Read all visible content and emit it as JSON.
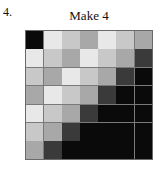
{
  "figure": {
    "item_number": "4.",
    "title": "Make 4"
  },
  "grid": {
    "rows": 7,
    "columns": 7,
    "palette": {
      "black": "#0a0a0a",
      "dark": "#3a3a3a",
      "mid": "#a8a8a8",
      "light_mid": "#c8c8c8",
      "very_light": "#e8e8e8"
    },
    "border_color": "#6a6a6a",
    "gridline_color": "#7a7a7a",
    "shade_names": [
      [
        "black",
        "very_light",
        "light_mid",
        "mid",
        "very_light",
        "light_mid",
        "mid"
      ],
      [
        "very_light",
        "light_mid",
        "mid",
        "very_light",
        "light_mid",
        "mid",
        "dark"
      ],
      [
        "light_mid",
        "mid",
        "very_light",
        "light_mid",
        "mid",
        "dark",
        "black"
      ],
      [
        "mid",
        "very_light",
        "light_mid",
        "mid",
        "dark",
        "black",
        "black"
      ],
      [
        "very_light",
        "light_mid",
        "mid",
        "dark",
        "black",
        "black",
        "black"
      ],
      [
        "light_mid",
        "mid",
        "dark",
        "black",
        "black",
        "black",
        "black"
      ],
      [
        "mid",
        "dark",
        "black",
        "black",
        "black",
        "black",
        "black"
      ]
    ]
  },
  "chart_data": {
    "type": "heatmap",
    "title": "Make 4",
    "xlabel": "",
    "ylabel": "",
    "categories": [
      "1",
      "2",
      "3",
      "4",
      "5",
      "6",
      "7"
    ],
    "rows": [
      "1",
      "2",
      "3",
      "4",
      "5",
      "6",
      "7"
    ],
    "grid": true,
    "legend": "none",
    "values": [
      [
        0,
        232,
        200,
        168,
        232,
        200,
        168
      ],
      [
        232,
        200,
        168,
        232,
        200,
        168,
        58
      ],
      [
        200,
        168,
        232,
        200,
        168,
        58,
        0
      ],
      [
        168,
        232,
        200,
        168,
        58,
        0,
        0
      ],
      [
        232,
        200,
        168,
        58,
        0,
        0,
        0
      ],
      [
        200,
        168,
        58,
        0,
        0,
        0,
        0
      ],
      [
        168,
        58,
        0,
        0,
        0,
        0,
        0
      ]
    ]
  }
}
